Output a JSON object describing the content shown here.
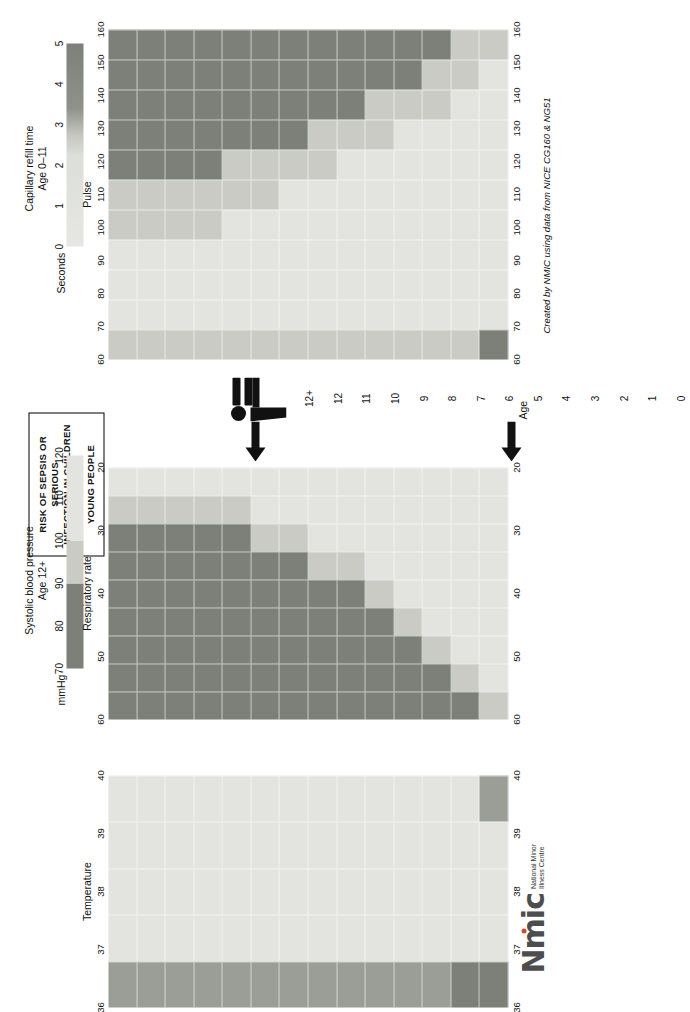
{
  "poster": {
    "title_lines": [
      "RISK OF SEPSIS OR SERIOUS",
      "INFECTION IN CHILDREN AND",
      "YOUNG PEOPLE"
    ],
    "age_axis_label": "Age",
    "credit": "Created by NMIC using data from NICE CG160 & NG51",
    "logo": {
      "word": "Nmic",
      "sub_line1": "National Minor",
      "sub_line2": "Illness Centre",
      "dot_color": "#d04a3a"
    },
    "person_icon": "person-icon",
    "arrow_icon": "arrow-left-icon"
  },
  "colors": {
    "low": "#e3e4e0",
    "medium": "#c9cbc4",
    "high": "#9b9e97",
    "red": "#7d7f79",
    "grid": "#ffffff",
    "text": "#111111"
  },
  "legends": [
    {
      "id": "capillary-refill",
      "title_line1": "Capillary refill time",
      "title_line2": "Age 0–11",
      "unit": "Seconds",
      "ticks": [
        "0",
        "1",
        "2",
        "3",
        "4",
        "5"
      ],
      "stops": [
        {
          "pos": 0,
          "color": "#e6e7e3"
        },
        {
          "pos": 45,
          "color": "#dcded9"
        },
        {
          "pos": 55,
          "color": "#c4c6bf"
        },
        {
          "pos": 68,
          "color": "#8f918b"
        },
        {
          "pos": 100,
          "color": "#7d7f79"
        }
      ]
    },
    {
      "id": "systolic-blood-pressure",
      "title_line1": "Systolic blood pressure",
      "title_line2": "Age 12+",
      "unit": "mmHg",
      "ticks": [
        "70",
        "80",
        "90",
        "100",
        "110",
        "120"
      ],
      "bands": [
        {
          "from": "70",
          "to": "90",
          "color": "#7d7f79"
        },
        {
          "from": "90",
          "to": "100",
          "color": "#c9cbc4"
        },
        {
          "from": "100",
          "to": "120",
          "color": "#e3e4e0"
        }
      ]
    }
  ],
  "age_labels": [
    "12+",
    "12",
    "11",
    "10",
    "9",
    "8",
    "7",
    "6",
    "5",
    "4",
    "3",
    "2",
    "1",
    "0"
  ],
  "chart_data": [
    {
      "id": "temperature",
      "type": "heatmap",
      "title": "Temperature",
      "xlabel": "Temperature",
      "ylabel": "Age",
      "xticks": [
        "36",
        "37",
        "38",
        "39",
        "40"
      ],
      "x_direction": "reversed",
      "categories_y": [
        "12+",
        "12",
        "11",
        "10",
        "9",
        "8",
        "7",
        "6",
        "5",
        "4",
        "3",
        "2",
        "1",
        "0"
      ],
      "x_bins": [
        "36",
        "37",
        "38",
        "39",
        "40"
      ],
      "risk_rows": [
        [
          "high",
          "low",
          "low",
          "low",
          "low"
        ],
        [
          "high",
          "low",
          "low",
          "low",
          "low"
        ],
        [
          "high",
          "low",
          "low",
          "low",
          "low"
        ],
        [
          "high",
          "low",
          "low",
          "low",
          "low"
        ],
        [
          "high",
          "low",
          "low",
          "low",
          "low"
        ],
        [
          "high",
          "low",
          "low",
          "low",
          "low"
        ],
        [
          "high",
          "low",
          "low",
          "low",
          "low"
        ],
        [
          "high",
          "low",
          "low",
          "low",
          "low"
        ],
        [
          "high",
          "low",
          "low",
          "low",
          "low"
        ],
        [
          "high",
          "low",
          "low",
          "low",
          "low"
        ],
        [
          "high",
          "low",
          "low",
          "low",
          "low"
        ],
        [
          "high",
          "low",
          "low",
          "low",
          "low"
        ],
        [
          "red",
          "low",
          "low",
          "low",
          "low"
        ],
        [
          "red",
          "low",
          "low",
          "low",
          "high"
        ]
      ]
    },
    {
      "id": "respiratory-rate",
      "type": "heatmap",
      "title": "Respiratory rate",
      "xlabel": "Respiratory rate",
      "ylabel": "Age",
      "xticks": [
        "60",
        "50",
        "40",
        "30",
        "20"
      ],
      "x_direction": "descending",
      "categories_y": [
        "12+",
        "12",
        "11",
        "10",
        "9",
        "8",
        "7",
        "6",
        "5",
        "4",
        "3",
        "2",
        "1",
        "0"
      ],
      "x_bins": [
        "60",
        "55",
        "50",
        "45",
        "40",
        "35",
        "30",
        "25",
        "20"
      ],
      "risk_rows": [
        [
          "red",
          "red",
          "red",
          "red",
          "red",
          "red",
          "red",
          "medium",
          "low"
        ],
        [
          "red",
          "red",
          "red",
          "red",
          "red",
          "red",
          "red",
          "medium",
          "low"
        ],
        [
          "red",
          "red",
          "red",
          "red",
          "red",
          "red",
          "red",
          "medium",
          "low"
        ],
        [
          "red",
          "red",
          "red",
          "red",
          "red",
          "red",
          "red",
          "medium",
          "low"
        ],
        [
          "red",
          "red",
          "red",
          "red",
          "red",
          "red",
          "red",
          "medium",
          "low"
        ],
        [
          "red",
          "red",
          "red",
          "red",
          "red",
          "red",
          "medium",
          "low",
          "low"
        ],
        [
          "red",
          "red",
          "red",
          "red",
          "red",
          "red",
          "medium",
          "low",
          "low"
        ],
        [
          "red",
          "red",
          "red",
          "red",
          "red",
          "medium",
          "low",
          "low",
          "low"
        ],
        [
          "red",
          "red",
          "red",
          "red",
          "red",
          "medium",
          "low",
          "low",
          "low"
        ],
        [
          "red",
          "red",
          "red",
          "red",
          "medium",
          "low",
          "low",
          "low",
          "low"
        ],
        [
          "red",
          "red",
          "red",
          "medium",
          "low",
          "low",
          "low",
          "low",
          "low"
        ],
        [
          "red",
          "red",
          "medium",
          "low",
          "low",
          "low",
          "low",
          "low",
          "low"
        ],
        [
          "red",
          "medium",
          "low",
          "low",
          "low",
          "low",
          "low",
          "low",
          "low"
        ],
        [
          "medium",
          "low",
          "low",
          "low",
          "low",
          "low",
          "low",
          "low",
          "low"
        ]
      ]
    },
    {
      "id": "pulse",
      "type": "heatmap",
      "title": "Pulse",
      "xlabel": "Pulse",
      "ylabel": "Age",
      "xticks": [
        "60",
        "70",
        "80",
        "90",
        "100",
        "110",
        "120",
        "130",
        "140",
        "150",
        "160"
      ],
      "x_direction": "ascending",
      "categories_y": [
        "12+",
        "12",
        "11",
        "10",
        "9",
        "8",
        "7",
        "6",
        "5",
        "4",
        "3",
        "2",
        "1",
        "0"
      ],
      "x_bins": [
        "60",
        "70",
        "80",
        "90",
        "100",
        "110",
        "120",
        "130",
        "140",
        "150",
        "160"
      ],
      "risk_rows": [
        [
          "medium",
          "low",
          "low",
          "low",
          "medium",
          "medium",
          "red",
          "red",
          "red",
          "red",
          "red"
        ],
        [
          "medium",
          "low",
          "low",
          "low",
          "medium",
          "medium",
          "red",
          "red",
          "red",
          "red",
          "red"
        ],
        [
          "medium",
          "low",
          "low",
          "low",
          "medium",
          "medium",
          "red",
          "red",
          "red",
          "red",
          "red"
        ],
        [
          "medium",
          "low",
          "low",
          "low",
          "medium",
          "medium",
          "red",
          "red",
          "red",
          "red",
          "red"
        ],
        [
          "medium",
          "low",
          "low",
          "low",
          "low",
          "medium",
          "medium",
          "red",
          "red",
          "red",
          "red"
        ],
        [
          "medium",
          "low",
          "low",
          "low",
          "low",
          "medium",
          "medium",
          "red",
          "red",
          "red",
          "red"
        ],
        [
          "medium",
          "low",
          "low",
          "low",
          "low",
          "low",
          "medium",
          "red",
          "red",
          "red",
          "red"
        ],
        [
          "medium",
          "low",
          "low",
          "low",
          "low",
          "low",
          "medium",
          "medium",
          "red",
          "red",
          "red"
        ],
        [
          "medium",
          "low",
          "low",
          "low",
          "low",
          "low",
          "low",
          "medium",
          "red",
          "red",
          "red"
        ],
        [
          "medium",
          "low",
          "low",
          "low",
          "low",
          "low",
          "low",
          "medium",
          "medium",
          "red",
          "red"
        ],
        [
          "medium",
          "low",
          "low",
          "low",
          "low",
          "low",
          "low",
          "low",
          "medium",
          "red",
          "red"
        ],
        [
          "medium",
          "low",
          "low",
          "low",
          "low",
          "low",
          "low",
          "low",
          "medium",
          "medium",
          "red"
        ],
        [
          "medium",
          "low",
          "low",
          "low",
          "low",
          "low",
          "low",
          "low",
          "low",
          "medium",
          "medium"
        ],
        [
          "red",
          "low",
          "low",
          "low",
          "low",
          "low",
          "low",
          "low",
          "low",
          "low",
          "medium"
        ]
      ]
    }
  ]
}
